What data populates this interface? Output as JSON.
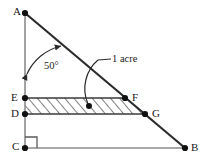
{
  "figure": {
    "canvas": {
      "width": 206,
      "height": 162
    },
    "colors": {
      "background": "#ffffff",
      "hypotenuse_stroke": "#2b2b2b",
      "leg_stroke": "#8c8c8c",
      "inner_stroke": "#3a3a3a",
      "hatch_stroke": "#4a4a4a",
      "vertex_fill": "#111111",
      "text": "#1a1a1a"
    },
    "vertices": [
      {
        "id": "A",
        "label": "A",
        "x": 25,
        "y": 13,
        "label_x": 13,
        "label_y": 6
      },
      {
        "id": "B",
        "label": "B",
        "x": 185,
        "y": 148,
        "label_x": 191,
        "label_y": 142
      },
      {
        "id": "C",
        "label": "C",
        "x": 25,
        "y": 148,
        "label_x": 12,
        "label_y": 141
      },
      {
        "id": "D",
        "label": "D",
        "x": 25,
        "y": 114,
        "label_x": 11,
        "label_y": 108
      },
      {
        "id": "E",
        "label": "E",
        "x": 25,
        "y": 98,
        "label_x": 11,
        "label_y": 92
      },
      {
        "id": "F",
        "label": "F",
        "x": 125,
        "y": 98,
        "label_x": 132,
        "label_y": 92
      },
      {
        "id": "G",
        "label": "G",
        "x": 145,
        "y": 114,
        "label_x": 152,
        "label_y": 108
      }
    ],
    "edges": [
      {
        "id": "AB",
        "from": "A",
        "to": "B",
        "role": "hypotenuse"
      },
      {
        "id": "AC",
        "from": "A",
        "to": "C",
        "role": "vertical-leg"
      },
      {
        "id": "CB",
        "from": "C",
        "to": "B",
        "role": "horizontal-leg"
      },
      {
        "id": "EF",
        "from": "E",
        "to": "F",
        "role": "upper-parallel"
      },
      {
        "id": "DG",
        "from": "D",
        "to": "G",
        "role": "lower-parallel"
      }
    ],
    "region": {
      "id": "EFGD",
      "points": "25,98 125,98 145,114 25,114",
      "fill_pattern": "diagonal-hatch",
      "marker_dot": {
        "x": 89,
        "y": 106
      }
    },
    "angle": {
      "value_label": "50°",
      "at_vertex": "A",
      "label_x": 44,
      "label_y": 61,
      "arc_path": "M 26 73 A 48 48 0 0 1 62 45",
      "arrow_start": {
        "x": 26,
        "y": 73
      },
      "arrow_end": {
        "x": 62,
        "y": 45
      }
    },
    "callout": {
      "text": "1 acre",
      "text_x": 112,
      "text_y": 55,
      "line_path": "M 111 59 L 97 60",
      "leader_path": "M 97 60 C 86 70, 82 88, 89 105",
      "target": {
        "x": 89,
        "y": 106
      }
    },
    "right_angle": {
      "at_vertex": "C",
      "path": "M 25 137 L 37 137 L 37 148",
      "size": 12
    }
  }
}
